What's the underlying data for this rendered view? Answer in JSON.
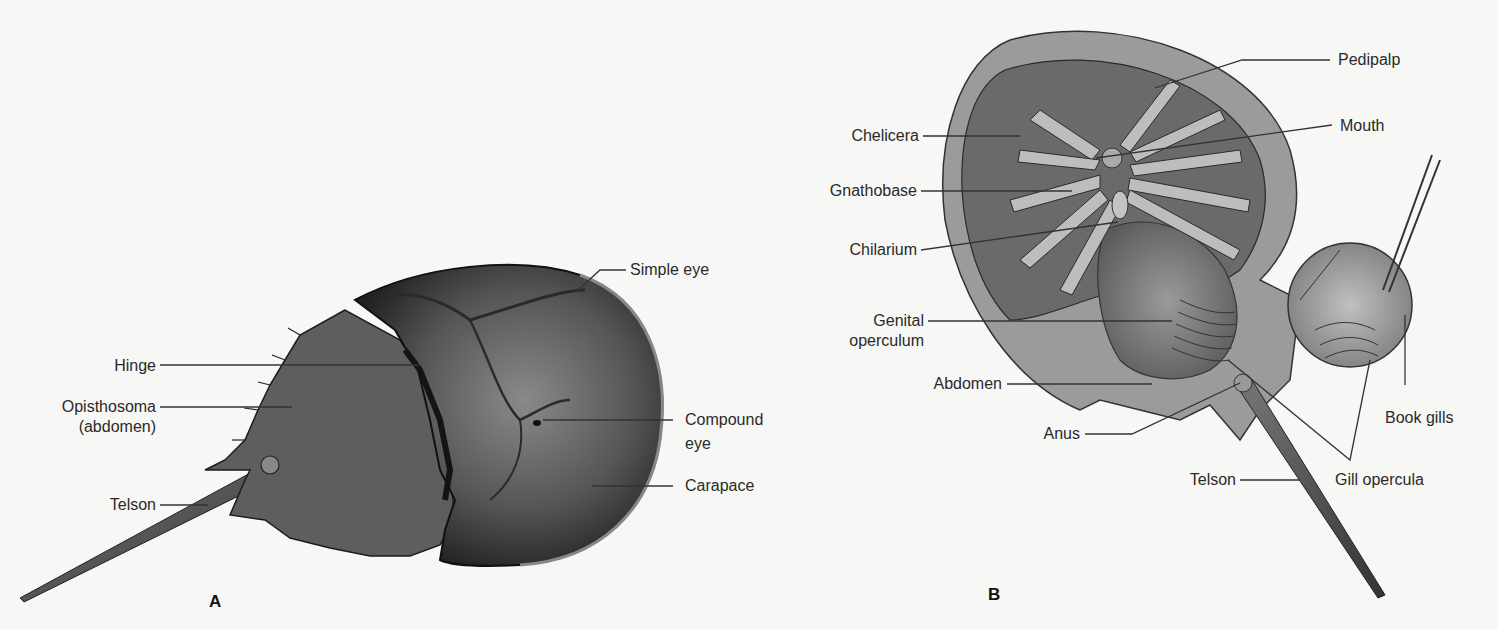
{
  "figure": {
    "panels": [
      {
        "id": "A",
        "letter": "A",
        "view": "dorsal",
        "labels": {
          "hinge": "Hinge",
          "opisthosoma_line1": "Opisthosoma",
          "opisthosoma_line2": "(abdomen)",
          "telson": "Telson",
          "simple_eye": "Simple eye",
          "compound_eye_line1": "Compound",
          "compound_eye_line2": "eye",
          "carapace": "Carapace"
        }
      },
      {
        "id": "B",
        "letter": "B",
        "view": "ventral",
        "labels": {
          "chelicera": "Chelicera",
          "gnathobase": "Gnathobase",
          "chilarium": "Chilarium",
          "genital_operculum_line1": "Genital",
          "genital_operculum_line2": "operculum",
          "abdomen": "Abdomen",
          "anus": "Anus",
          "telson": "Telson",
          "pedipalp": "Pedipalp",
          "mouth": "Mouth",
          "book_gills": "Book gills",
          "gill_opercula": "Gill opercula"
        }
      }
    ]
  },
  "colors": {
    "background": "#f7f7f5",
    "label_text": "#2a2a2a",
    "leader_line": "#333333",
    "shell_dark": "#2e2e2e",
    "shell_mid": "#6a6a6a",
    "shell_light": "#9a9a9a",
    "ventral_light": "#b8b8b8"
  }
}
